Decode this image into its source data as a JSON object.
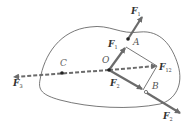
{
  "diagram": {
    "points": {
      "A": "A",
      "O": "O",
      "B": "B",
      "C": "C"
    },
    "forces": {
      "F1_top": {
        "main": "F",
        "sub": "1"
      },
      "F1_inner": {
        "main": "F",
        "sub": "1"
      },
      "F2_inner": {
        "main": "F",
        "sub": "2"
      },
      "F2_bottom": {
        "main": "F",
        "sub": "2"
      },
      "F3": {
        "main": "F",
        "sub": "3"
      },
      "F12": {
        "main": "F",
        "sub": "12"
      }
    },
    "colors": {
      "vector": "#6b6b6b",
      "outline": "#555555",
      "dashed": "#6b6b6b"
    }
  }
}
